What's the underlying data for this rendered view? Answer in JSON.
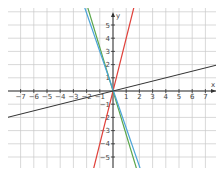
{
  "chart_data": {
    "type": "line",
    "title": "",
    "xlabel": "x",
    "ylabel": "y",
    "xlim": [
      -7.8,
      7.8
    ],
    "ylim": [
      -5.5,
      6.5
    ],
    "grid": true,
    "x_ticks": [
      -7,
      -6,
      -5,
      -4,
      -3,
      -2,
      -1,
      1,
      2,
      3,
      4,
      5,
      6,
      7
    ],
    "y_ticks": [
      -5,
      -4,
      -3,
      -2,
      -1,
      1,
      2,
      3,
      4,
      5
    ],
    "series": [
      {
        "name": "red line",
        "color": "#e0403a",
        "slope": 4,
        "intercept": 0
      },
      {
        "name": "green line",
        "color": "#5aa64a",
        "slope": -3.3,
        "intercept": 0
      },
      {
        "name": "blue line",
        "color": "#4aa3d8",
        "slope": -2.9,
        "intercept": 0.1
      },
      {
        "name": "black line",
        "color": "#333333",
        "slope": 0.25,
        "intercept": 0
      }
    ]
  },
  "axis": {
    "x_label": "x",
    "y_label": "y"
  }
}
